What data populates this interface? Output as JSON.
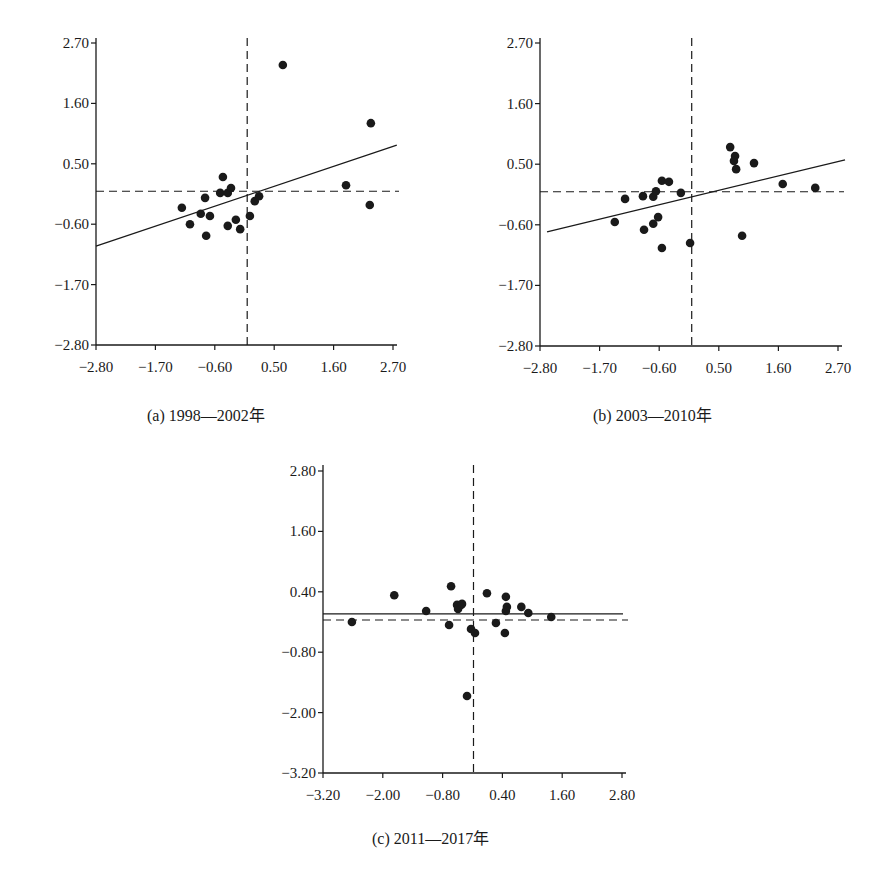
{
  "chart_data": [
    {
      "id": "a",
      "type": "scatter",
      "title": "(a) 1998—2002年",
      "xlabel": "",
      "ylabel": "",
      "xlim": [
        -2.8,
        2.7
      ],
      "ylim": [
        -2.8,
        2.7
      ],
      "xticks": [
        "-2.80",
        "-1.70",
        "-0.60",
        "0.50",
        "1.60",
        "2.70"
      ],
      "yticks": [
        "2.70",
        "1.60",
        "0.50",
        "-0.60",
        "-1.70",
        "-2.80"
      ],
      "grid": false,
      "reference_lines": {
        "vertical_dashed_x": 0.0,
        "horizontal_dashed_y": 0.0
      },
      "regression_line": {
        "x": [
          -2.8,
          2.77
        ],
        "y": [
          -1.0,
          0.84
        ]
      },
      "points": [
        [
          -1.21,
          -0.3
        ],
        [
          -1.06,
          -0.6
        ],
        [
          -0.86,
          -0.41
        ],
        [
          -0.78,
          -0.12
        ],
        [
          -0.76,
          -0.81
        ],
        [
          -0.69,
          -0.45
        ],
        [
          -0.45,
          0.26
        ],
        [
          -0.5,
          -0.03
        ],
        [
          -0.36,
          -0.03
        ],
        [
          -0.3,
          0.06
        ],
        [
          -0.36,
          -0.63
        ],
        [
          -0.21,
          -0.52
        ],
        [
          -0.13,
          -0.69
        ],
        [
          0.05,
          -0.45
        ],
        [
          0.14,
          -0.18
        ],
        [
          0.22,
          -0.09
        ],
        [
          0.66,
          2.3
        ],
        [
          1.83,
          0.11
        ],
        [
          2.29,
          1.24
        ],
        [
          2.27,
          -0.25
        ]
      ]
    },
    {
      "id": "b",
      "type": "scatter",
      "title": "(b) 2003—2010年",
      "xlabel": "",
      "ylabel": "",
      "xlim": [
        -2.8,
        2.7
      ],
      "ylim": [
        -2.8,
        2.7
      ],
      "xticks": [
        "-2.80",
        "-1.70",
        "-0.60",
        "0.50",
        "1.60",
        "2.70"
      ],
      "yticks": [
        "2.70",
        "1.60",
        "0.50",
        "-0.60",
        "-1.70",
        "-2.80"
      ],
      "grid": false,
      "reference_lines": {
        "vertical_dashed_x": 0.0,
        "horizontal_dashed_y": 0.0
      },
      "regression_line": {
        "x": [
          -2.67,
          2.83
        ],
        "y": [
          -0.73,
          0.58
        ]
      },
      "points": [
        [
          -1.42,
          -0.55
        ],
        [
          -1.23,
          -0.13
        ],
        [
          -0.9,
          -0.08
        ],
        [
          -0.71,
          -0.09
        ],
        [
          -0.66,
          0.01
        ],
        [
          -0.55,
          0.2
        ],
        [
          -0.42,
          0.18
        ],
        [
          -0.2,
          -0.02
        ],
        [
          -0.88,
          -0.69
        ],
        [
          -0.71,
          -0.58
        ],
        [
          -0.62,
          -0.46
        ],
        [
          -0.55,
          -1.02
        ],
        [
          -0.03,
          -0.93
        ],
        [
          0.71,
          0.81
        ],
        [
          0.8,
          0.65
        ],
        [
          0.78,
          0.56
        ],
        [
          0.82,
          0.41
        ],
        [
          1.15,
          0.52
        ],
        [
          0.93,
          -0.8
        ],
        [
          1.68,
          0.14
        ],
        [
          2.28,
          0.07
        ]
      ]
    },
    {
      "id": "c",
      "type": "scatter",
      "title": "(c) 2011—2017年",
      "xlabel": "",
      "ylabel": "",
      "xlim": [
        -3.2,
        2.8
      ],
      "ylim": [
        -3.2,
        2.8
      ],
      "xticks": [
        "-3.20",
        "-2.00",
        "-0.80",
        "0.40",
        "1.60",
        "2.80"
      ],
      "yticks": [
        "2.80",
        "1.60",
        "0.40",
        "-0.80",
        "-2.00",
        "-3.20"
      ],
      "grid": false,
      "reference_lines": {
        "vertical_dashed_x": -0.18,
        "horizontal_dashed_y": -0.16
      },
      "regression_line": {
        "x": [
          -3.2,
          2.82
        ],
        "y": [
          -0.04,
          -0.04
        ]
      },
      "points": [
        [
          -2.62,
          -0.2
        ],
        [
          -1.77,
          0.33
        ],
        [
          -1.13,
          0.02
        ],
        [
          -0.63,
          0.51
        ],
        [
          -0.67,
          -0.26
        ],
        [
          -0.51,
          0.14
        ],
        [
          -0.49,
          0.06
        ],
        [
          -0.43,
          0.14
        ],
        [
          -0.41,
          0.16
        ],
        [
          -0.23,
          -0.34
        ],
        [
          -0.15,
          -0.42
        ],
        [
          -0.31,
          -1.67
        ],
        [
          0.09,
          0.37
        ],
        [
          0.27,
          -0.22
        ],
        [
          0.47,
          0.3
        ],
        [
          0.49,
          0.1
        ],
        [
          0.47,
          0.02
        ],
        [
          0.45,
          -0.42
        ],
        [
          0.78,
          0.1
        ],
        [
          0.92,
          -0.02
        ],
        [
          1.38,
          -0.1
        ]
      ]
    }
  ],
  "captions": {
    "a": "(a)  1998—2002年",
    "b": "(b)  2003—2010年",
    "c": "(c)  2011—2017年"
  },
  "colors": {
    "ink": "#1a1a1a",
    "background": "#ffffff"
  }
}
